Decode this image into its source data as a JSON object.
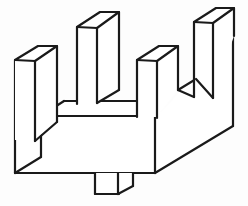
{
  "figure": {
    "title": "Isometric comb-shaped block",
    "description": "Black-and-white axonometric line drawing of a rectangular slab base carrying four upright rectangular prongs of alternating heights, with a small rectangular peg projecting from the underside of the base.",
    "background_color": "#fdfdfd",
    "stroke_color": "#1a1a1a",
    "fill_color": "#ffffff",
    "stroke_width": 2.2,
    "projection": "oblique-axonometric",
    "width": 248,
    "height": 206,
    "parts": [
      {
        "name": "prong-1",
        "label": "Left short prong",
        "height_rank": "short"
      },
      {
        "name": "prong-2",
        "label": "Second tall prong",
        "height_rank": "tall"
      },
      {
        "name": "prong-3",
        "label": "Third short prong",
        "height_rank": "short"
      },
      {
        "name": "prong-4",
        "label": "Right tall prong",
        "height_rank": "tall"
      },
      {
        "name": "base-slab",
        "label": "Base slab",
        "height_rank": "base"
      },
      {
        "name": "bottom-peg",
        "label": "Underside peg",
        "height_rank": "peg"
      }
    ],
    "shapes": {
      "base_front_face": "M 15,62 L 15,173 L 155,173 L 155,115 L 15,115 Z",
      "base_front_outline": "M 15,173 L 155,173",
      "base_front_left_edge": "M 15,60 L 15,173",
      "base_right_vertical": "M 155,118 L 155,173",
      "base_bottom_right_diagonal": "M 155,173 L 233,125",
      "base_right_far_vertical": "M 233,125 L 233,36",
      "inner_floor_left_diag": "M 15,173 L 41,156",
      "inner_floor_top": "M 41,156 L 41,116",
      "inner_floor_front": "M 41,116 L 138,116",
      "inner_floor_right_diag": "M 138,116 L 160,102",
      "inner_back_top": "M 41,116 L 64,101",
      "valley_left_wall": "M 64,101 L 64,87",
      "valley_floor": "M 64,101 L 135,101",
      "valley_right_wall": "M 135,101 L 135,73",
      "notch_34_floor": "M 177,90 L 196,78",
      "notch_34_left": "M 160,90 L 177,90",
      "peg_left": "M 95,173 L 95,194",
      "peg_bottom": "M 95,194 L 133,194",
      "peg_right_front": "M 133,194 L 133,178",
      "peg_diag": "M 133,178 L 147,170",
      "peg_inner_vertical": "M 118,173 L 118,194"
    }
  }
}
